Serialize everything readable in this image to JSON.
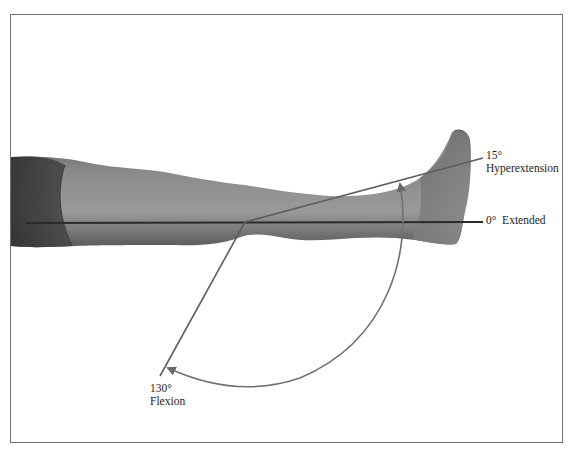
{
  "figure": {
    "labels": {
      "hyperextension": {
        "angle": "15°",
        "name": "Hyperextension"
      },
      "extended": {
        "angle": "0°",
        "name": "Extended"
      },
      "flexion": {
        "angle": "130°",
        "name": "Flexion"
      }
    },
    "colors": {
      "frame": "#6f6f6f",
      "reference_line": "#2a2a2a",
      "movement_line": "#5e5e5e",
      "arc": "#707070",
      "skin_dark": "#3a3a3a",
      "skin_mid": "#7e7e7e",
      "skin_light": "#a4a4a4"
    }
  }
}
